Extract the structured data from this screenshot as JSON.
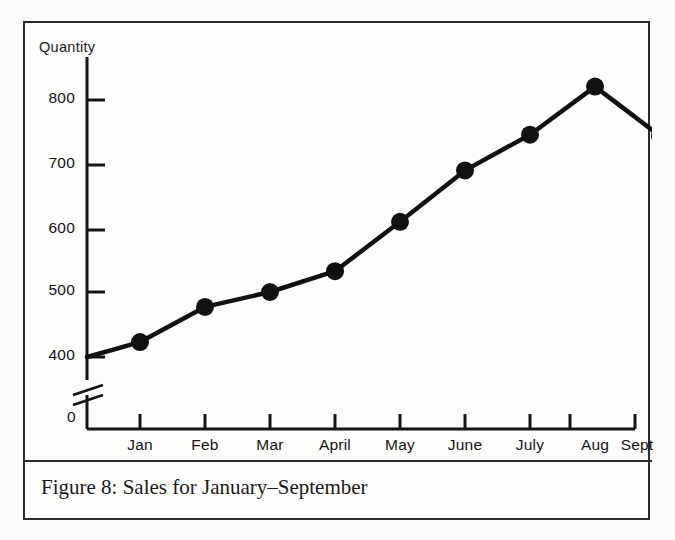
{
  "figure": {
    "caption": "Figure 8: Sales for January–September",
    "y_axis_title": "Quantity",
    "zero_label": "0",
    "axis_break": "double-slash-break"
  },
  "colors": {
    "ink": "#141414",
    "frame": "#2b2b2b",
    "paper": "#fdfdfc",
    "line": "#111111",
    "marker": "#111111"
  },
  "chart_data": {
    "type": "line",
    "title": "Figure 8: Sales for January–September",
    "xlabel": "",
    "ylabel": "Quantity",
    "categories": [
      "Jan",
      "Feb",
      "Mar",
      "April",
      "May",
      "June",
      "July",
      "Aug",
      "Sept"
    ],
    "values": [
      423,
      477,
      500,
      532,
      608,
      687,
      742,
      816,
      740
    ],
    "origin_value": 400,
    "yticks": [
      400,
      500,
      600,
      700,
      800
    ],
    "ytick_labels": [
      "400",
      "500",
      "600",
      "700",
      "800"
    ],
    "ylim": [
      400,
      840
    ],
    "grid": false,
    "legend": false,
    "axis_break": true,
    "marker": "filled-circle",
    "series": [
      {
        "name": "Sales",
        "values": [
          423,
          477,
          500,
          532,
          608,
          687,
          742,
          816,
          740
        ]
      }
    ]
  }
}
